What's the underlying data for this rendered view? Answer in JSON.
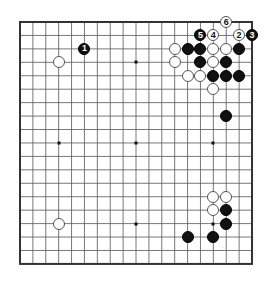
{
  "board": {
    "size": 19,
    "origin_x": 20,
    "origin_y": 22,
    "step_x": 12.89,
    "step_y": 13.44,
    "line_color": "#555555",
    "border_color": "#333333",
    "hoshi": [
      [
        3,
        3
      ],
      [
        9,
        3
      ],
      [
        15,
        3
      ],
      [
        3,
        9
      ],
      [
        9,
        9
      ],
      [
        15,
        9
      ],
      [
        3,
        15
      ],
      [
        9,
        15
      ],
      [
        15,
        15
      ]
    ]
  },
  "stones": [
    {
      "color": "white",
      "col": 3,
      "row": 3,
      "label": ""
    },
    {
      "color": "black",
      "col": 5,
      "row": 2,
      "label": "1"
    },
    {
      "color": "white",
      "col": 17,
      "row": 1,
      "label": "2"
    },
    {
      "color": "black",
      "col": 18,
      "row": 1,
      "label": "3"
    },
    {
      "color": "white",
      "col": 15,
      "row": 1,
      "label": "4"
    },
    {
      "color": "black",
      "col": 14,
      "row": 1,
      "label": "5"
    },
    {
      "color": "white",
      "col": 16,
      "row": 0,
      "label": "6"
    },
    {
      "color": "white",
      "col": 12,
      "row": 2,
      "label": ""
    },
    {
      "color": "black",
      "col": 13,
      "row": 2,
      "label": ""
    },
    {
      "color": "black",
      "col": 14,
      "row": 2,
      "label": ""
    },
    {
      "color": "white",
      "col": 15,
      "row": 2,
      "label": ""
    },
    {
      "color": "white",
      "col": 16,
      "row": 2,
      "label": ""
    },
    {
      "color": "black",
      "col": 17,
      "row": 2,
      "label": ""
    },
    {
      "color": "white",
      "col": 12,
      "row": 3,
      "label": ""
    },
    {
      "color": "black",
      "col": 14,
      "row": 3,
      "label": ""
    },
    {
      "color": "white",
      "col": 15,
      "row": 3,
      "label": ""
    },
    {
      "color": "black",
      "col": 16,
      "row": 3,
      "label": ""
    },
    {
      "color": "white",
      "col": 13,
      "row": 4,
      "label": ""
    },
    {
      "color": "white",
      "col": 14,
      "row": 4,
      "label": ""
    },
    {
      "color": "black",
      "col": 15,
      "row": 4,
      "label": ""
    },
    {
      "color": "black",
      "col": 16,
      "row": 4,
      "label": ""
    },
    {
      "color": "black",
      "col": 17,
      "row": 4,
      "label": ""
    },
    {
      "color": "white",
      "col": 15,
      "row": 5,
      "label": ""
    },
    {
      "color": "black",
      "col": 16,
      "row": 7,
      "label": ""
    },
    {
      "color": "white",
      "col": 15,
      "row": 13,
      "label": ""
    },
    {
      "color": "white",
      "col": 16,
      "row": 13,
      "label": ""
    },
    {
      "color": "white",
      "col": 15,
      "row": 14,
      "label": ""
    },
    {
      "color": "black",
      "col": 16,
      "row": 14,
      "label": ""
    },
    {
      "color": "black",
      "col": 16,
      "row": 15,
      "label": ""
    },
    {
      "color": "black",
      "col": 13,
      "row": 16,
      "label": ""
    },
    {
      "color": "black",
      "col": 15,
      "row": 16,
      "label": ""
    },
    {
      "color": "white",
      "col": 3,
      "row": 15,
      "label": ""
    }
  ]
}
